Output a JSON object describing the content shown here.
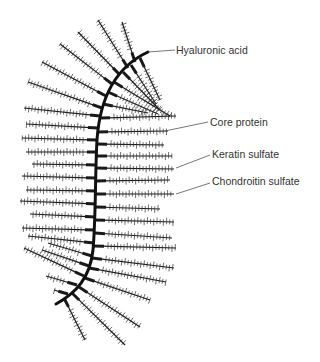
{
  "diagram": {
    "colors": {
      "ink": "#1a1a1a",
      "label": "#333333",
      "leader": "#555555",
      "background": "#ffffff"
    },
    "backbone": {
      "name": "Hyaluronic acid",
      "path": "M148,52 C118,66 100,95 97,140 C95,175 96,215 93,250 C90,278 76,293 56,304"
    },
    "labels": [
      {
        "id": "hyaluronic-acid",
        "text": "Hyaluronic acid",
        "x": 176,
        "y": 44,
        "leader": [
          148,
          52,
          175,
          50
        ]
      },
      {
        "id": "core-protein",
        "text": "Core protein",
        "x": 210,
        "y": 116,
        "leader": [
          165,
          131,
          208,
          122
        ]
      },
      {
        "id": "keratin-sulfate",
        "text": "Keratin sulfate",
        "x": 212,
        "y": 148,
        "leader": [
          176,
          168,
          210,
          155
        ]
      },
      {
        "id": "chondroitin-sulfate",
        "text": "Chondroitin sulfate",
        "x": 212,
        "y": 175,
        "leader": [
          176,
          194,
          210,
          183
        ]
      }
    ],
    "branches": [
      {
        "x1": 135,
        "y1": 62,
        "x2": 122,
        "y2": 22
      },
      {
        "x1": 128,
        "y1": 68,
        "x2": 98,
        "y2": 20
      },
      {
        "x1": 120,
        "y1": 75,
        "x2": 78,
        "y2": 32
      },
      {
        "x1": 112,
        "y1": 84,
        "x2": 60,
        "y2": 44
      },
      {
        "x1": 106,
        "y1": 96,
        "x2": 42,
        "y2": 62
      },
      {
        "x1": 102,
        "y1": 108,
        "x2": 28,
        "y2": 82
      },
      {
        "x1": 100,
        "y1": 116,
        "x2": 24,
        "y2": 108
      },
      {
        "x1": 98,
        "y1": 128,
        "x2": 26,
        "y2": 124
      },
      {
        "x1": 97,
        "y1": 140,
        "x2": 22,
        "y2": 138
      },
      {
        "x1": 97,
        "y1": 152,
        "x2": 26,
        "y2": 152
      },
      {
        "x1": 96,
        "y1": 165,
        "x2": 32,
        "y2": 164
      },
      {
        "x1": 96,
        "y1": 178,
        "x2": 22,
        "y2": 176
      },
      {
        "x1": 96,
        "y1": 191,
        "x2": 26,
        "y2": 190
      },
      {
        "x1": 96,
        "y1": 204,
        "x2": 20,
        "y2": 201
      },
      {
        "x1": 95,
        "y1": 217,
        "x2": 30,
        "y2": 214
      },
      {
        "x1": 95,
        "y1": 230,
        "x2": 22,
        "y2": 228
      },
      {
        "x1": 94,
        "y1": 243,
        "x2": 28,
        "y2": 236
      },
      {
        "x1": 92,
        "y1": 256,
        "x2": 48,
        "y2": 243
      },
      {
        "x1": 89,
        "y1": 266,
        "x2": 42,
        "y2": 250
      },
      {
        "x1": 84,
        "y1": 276,
        "x2": 24,
        "y2": 248
      },
      {
        "x1": 77,
        "y1": 285,
        "x2": 46,
        "y2": 276
      },
      {
        "x1": 68,
        "y1": 294,
        "x2": 54,
        "y2": 290
      },
      {
        "x1": 140,
        "y1": 58,
        "x2": 160,
        "y2": 100
      },
      {
        "x1": 131,
        "y1": 65,
        "x2": 156,
        "y2": 104
      },
      {
        "x1": 123,
        "y1": 72,
        "x2": 160,
        "y2": 110
      },
      {
        "x1": 114,
        "y1": 82,
        "x2": 170,
        "y2": 116
      },
      {
        "x1": 108,
        "y1": 92,
        "x2": 158,
        "y2": 114
      },
      {
        "x1": 103,
        "y1": 104,
        "x2": 148,
        "y2": 113
      },
      {
        "x1": 100,
        "y1": 118,
        "x2": 176,
        "y2": 116
      },
      {
        "x1": 98,
        "y1": 132,
        "x2": 168,
        "y2": 131
      },
      {
        "x1": 97,
        "y1": 144,
        "x2": 164,
        "y2": 145
      },
      {
        "x1": 97,
        "y1": 156,
        "x2": 172,
        "y2": 156
      },
      {
        "x1": 97,
        "y1": 168,
        "x2": 174,
        "y2": 169
      },
      {
        "x1": 96,
        "y1": 181,
        "x2": 170,
        "y2": 180
      },
      {
        "x1": 96,
        "y1": 194,
        "x2": 174,
        "y2": 194
      },
      {
        "x1": 96,
        "y1": 207,
        "x2": 160,
        "y2": 209
      },
      {
        "x1": 95,
        "y1": 220,
        "x2": 174,
        "y2": 222
      },
      {
        "x1": 95,
        "y1": 233,
        "x2": 172,
        "y2": 238
      },
      {
        "x1": 94,
        "y1": 246,
        "x2": 176,
        "y2": 248
      },
      {
        "x1": 92,
        "y1": 258,
        "x2": 174,
        "y2": 268
      },
      {
        "x1": 89,
        "y1": 268,
        "x2": 166,
        "y2": 282
      },
      {
        "x1": 85,
        "y1": 278,
        "x2": 150,
        "y2": 300
      },
      {
        "x1": 79,
        "y1": 287,
        "x2": 140,
        "y2": 327
      },
      {
        "x1": 72,
        "y1": 293,
        "x2": 125,
        "y2": 345
      },
      {
        "x1": 64,
        "y1": 298,
        "x2": 85,
        "y2": 340
      }
    ]
  }
}
